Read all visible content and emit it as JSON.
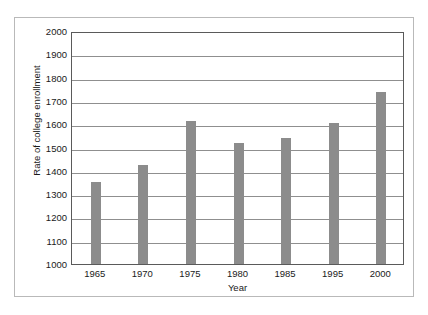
{
  "chart_data": {
    "type": "bar",
    "title": "",
    "xlabel": "Year",
    "ylabel": "Rate of college enrollment",
    "categories": [
      "1965",
      "1970",
      "1975",
      "1980",
      "1985",
      "1995",
      "2000"
    ],
    "values": [
      1352,
      1425,
      1612,
      1520,
      1540,
      1605,
      1740
    ],
    "series": [
      {
        "name": "Rate of college enrollment",
        "values": [
          1352,
          1425,
          1612,
          1520,
          1540,
          1605,
          1740
        ]
      }
    ],
    "ylim": [
      1000,
      2000
    ],
    "ytick_labels": [
      "2000",
      "1900",
      "1800",
      "1700",
      "1600",
      "1500",
      "1400",
      "1300",
      "1200",
      "1100",
      "1000"
    ],
    "ytick_values": [
      2000,
      1900,
      1800,
      1700,
      1600,
      1500,
      1400,
      1300,
      1200,
      1100,
      1000
    ],
    "ytick_step": 100,
    "grid": true,
    "grid_axis": "y",
    "legend": false,
    "legend_position": "none",
    "bar_color": "#8c8c8c",
    "axis_color": "#5a5a5a",
    "grid_color": "#8f8f8f",
    "frame_color": "#b9b9b9",
    "background_color": "#ffffff",
    "text_color": "#1a1a1a"
  }
}
